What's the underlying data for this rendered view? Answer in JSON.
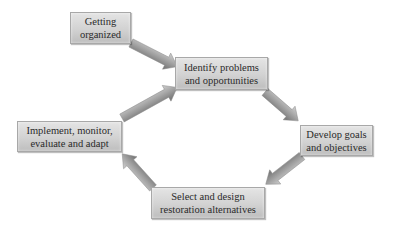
{
  "diagram": {
    "type": "cycle-flowchart",
    "colors": {
      "background": "#ffffff",
      "box_fill_top": "#e4e4e4",
      "box_fill_bottom": "#bdbdbd",
      "box_border": "#a8a8a8",
      "arrow_light": "#c8c8c8",
      "arrow_dark": "#7a7a7a",
      "text": "#2a2a2a"
    },
    "nodes": [
      {
        "id": "getting-organized",
        "line1": "Getting",
        "line2": "organized"
      },
      {
        "id": "identify",
        "line1": "Identify problems",
        "line2": "and opportunities"
      },
      {
        "id": "develop",
        "line1": "Develop goals",
        "line2": "and objectives"
      },
      {
        "id": "select",
        "line1": "Select and design",
        "line2": "restoration alternatives"
      },
      {
        "id": "implement",
        "line1": "Implement, monitor,",
        "line2": "evaluate and adapt"
      }
    ],
    "edges": [
      {
        "from": "getting-organized",
        "to": "identify",
        "icon": "arrow-right-down-icon"
      },
      {
        "from": "identify",
        "to": "develop",
        "icon": "arrow-right-down-icon"
      },
      {
        "from": "develop",
        "to": "select",
        "icon": "arrow-left-down-icon"
      },
      {
        "from": "select",
        "to": "implement",
        "icon": "arrow-left-up-icon"
      },
      {
        "from": "implement",
        "to": "identify",
        "icon": "arrow-right-up-icon"
      }
    ]
  }
}
